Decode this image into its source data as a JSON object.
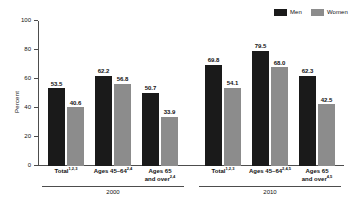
{
  "legend": {
    "position": "top-right",
    "entries": [
      {
        "label": "Men",
        "color": "#1a1a1a",
        "swatch_name": "legend-swatch-men"
      },
      {
        "label": "Women",
        "color": "#8c8c8c",
        "swatch_name": "legend-swatch-women"
      }
    ]
  },
  "chart_data": {
    "type": "bar",
    "title": "",
    "subtitle": "",
    "xlabel": "",
    "ylabel": "Percent",
    "ylim": [
      0,
      100
    ],
    "yticks": [
      0,
      20,
      40,
      60,
      80,
      100
    ],
    "ytick_labels": [
      "0",
      "20",
      "40",
      "60",
      "80",
      "100"
    ],
    "grid": false,
    "legend_position": "top-right",
    "group_axis_label": "Year",
    "groups": [
      {
        "name": "2000",
        "categories": [
          {
            "label": "Total",
            "footnote": "1,2,3"
          },
          {
            "label": "Ages 45–64",
            "footnote": "2,4"
          },
          {
            "label": "Ages 65 and over",
            "label_line1": "Ages 65",
            "label_line2": "and over",
            "footnote": "2,4"
          }
        ],
        "series": [
          {
            "name": "Men",
            "values": [
              53.5,
              62.2,
              50.7
            ]
          },
          {
            "name": "Women",
            "values": [
              40.6,
              56.8,
              33.9
            ]
          }
        ]
      },
      {
        "name": "2010",
        "categories": [
          {
            "label": "Total",
            "footnote": "1,2,3"
          },
          {
            "label": "Ages 45–64",
            "footnote": "2,4,5"
          },
          {
            "label": "Ages 65 and over",
            "label_line1": "Ages 65",
            "label_line2": "and over",
            "footnote": "4,5"
          }
        ],
        "series": [
          {
            "name": "Men",
            "values": [
              69.8,
              79.5,
              62.3
            ]
          },
          {
            "name": "Women",
            "values": [
              54.1,
              68.0,
              42.5
            ]
          }
        ]
      }
    ],
    "all_values": [
      53.5,
      40.6,
      62.2,
      56.8,
      50.7,
      33.9,
      69.8,
      54.1,
      79.5,
      68.0,
      62.3,
      42.5
    ],
    "colors": {
      "men": "#1a1a1a",
      "women": "#8c8c8c",
      "axis": "#4d4d4d",
      "background": "#ffffff"
    }
  }
}
